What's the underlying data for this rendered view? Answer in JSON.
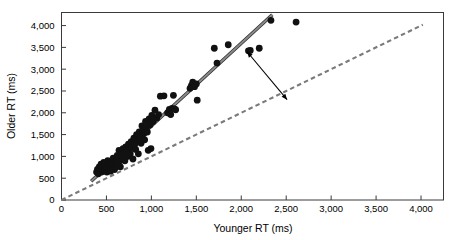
{
  "chart_data": {
    "type": "scatter",
    "title": "",
    "xlabel": "Younger RT (ms)",
    "ylabel": "Older RT (ms)",
    "xlim": [
      0,
      4250
    ],
    "ylim": [
      0,
      4300
    ],
    "xticks": [
      0,
      500,
      1000,
      1500,
      2000,
      2500,
      3000,
      3500,
      4000
    ],
    "xtick_labels": [
      "0",
      "500",
      "1,000",
      "1,500",
      "2,000",
      "2,500",
      "3,000",
      "3,500",
      "4,000"
    ],
    "yticks": [
      0,
      500,
      1000,
      1500,
      2000,
      2500,
      3000,
      3500,
      4000
    ],
    "ytick_labels": [
      "0",
      "500",
      "1,000",
      "1,500",
      "2,000",
      "2,500",
      "3,000",
      "3,500",
      "4,000"
    ],
    "grid": false,
    "legend": "none",
    "marker": "filled-circle",
    "marker_color": "#111111",
    "marker_size": 4.6,
    "points": [
      [
        390,
        640
      ],
      [
        400,
        700
      ],
      [
        410,
        600
      ],
      [
        420,
        760
      ],
      [
        430,
        690
      ],
      [
        440,
        820
      ],
      [
        445,
        640
      ],
      [
        455,
        740
      ],
      [
        460,
        700
      ],
      [
        470,
        860
      ],
      [
        480,
        660
      ],
      [
        490,
        780
      ],
      [
        500,
        720
      ],
      [
        505,
        640
      ],
      [
        515,
        900
      ],
      [
        520,
        760
      ],
      [
        530,
        700
      ],
      [
        540,
        840
      ],
      [
        545,
        660
      ],
      [
        555,
        780
      ],
      [
        565,
        720
      ],
      [
        575,
        960
      ],
      [
        585,
        800
      ],
      [
        590,
        700
      ],
      [
        600,
        880
      ],
      [
        610,
        760
      ],
      [
        620,
        1020
      ],
      [
        630,
        840
      ],
      [
        640,
        1140
      ],
      [
        650,
        900
      ],
      [
        655,
        760
      ],
      [
        665,
        1080
      ],
      [
        675,
        980
      ],
      [
        685,
        1180
      ],
      [
        695,
        1060
      ],
      [
        705,
        900
      ],
      [
        715,
        1220
      ],
      [
        725,
        1120
      ],
      [
        735,
        1000
      ],
      [
        745,
        1280
      ],
      [
        755,
        1160
      ],
      [
        765,
        1060
      ],
      [
        775,
        1340
      ],
      [
        785,
        1200
      ],
      [
        795,
        940
      ],
      [
        805,
        1420
      ],
      [
        815,
        1280
      ],
      [
        825,
        1160
      ],
      [
        835,
        1500
      ],
      [
        845,
        1380
      ],
      [
        855,
        1060
      ],
      [
        865,
        1560
      ],
      [
        875,
        1440
      ],
      [
        885,
        1300
      ],
      [
        895,
        1700
      ],
      [
        905,
        1620
      ],
      [
        915,
        1520
      ],
      [
        925,
        1380
      ],
      [
        935,
        1800
      ],
      [
        945,
        1660
      ],
      [
        955,
        1560
      ],
      [
        965,
        1140
      ],
      [
        975,
        1860
      ],
      [
        985,
        1720
      ],
      [
        995,
        1180
      ],
      [
        1005,
        1940
      ],
      [
        1020,
        1800
      ],
      [
        1040,
        2060
      ],
      [
        1060,
        1880
      ],
      [
        1080,
        1960
      ],
      [
        1100,
        2380
      ],
      [
        1140,
        2390
      ],
      [
        1180,
        2000
      ],
      [
        1200,
        2080
      ],
      [
        1215,
        1960
      ],
      [
        1230,
        2100
      ],
      [
        1245,
        2400
      ],
      [
        1255,
        2090
      ],
      [
        1270,
        2070
      ],
      [
        1430,
        2560
      ],
      [
        1445,
        2620
      ],
      [
        1460,
        2700
      ],
      [
        1480,
        2600
      ],
      [
        1500,
        2660
      ],
      [
        1510,
        2290
      ],
      [
        1700,
        3480
      ],
      [
        1730,
        3140
      ],
      [
        1855,
        3560
      ],
      [
        2080,
        3420
      ],
      [
        2100,
        3430
      ],
      [
        2200,
        3480
      ],
      [
        2330,
        4120
      ],
      [
        2610,
        4080
      ]
    ],
    "lines": [
      {
        "name": "regression-line",
        "style": "solid",
        "color": "#8a8a8a",
        "edge_color": "#2b2b2b",
        "x": [
          330,
          2345
        ],
        "y": [
          430,
          4250
        ]
      },
      {
        "name": "identity-line",
        "style": "dashed",
        "color": "#7a7a7a",
        "x": [
          0,
          4020
        ],
        "y": [
          0,
          4020
        ]
      }
    ],
    "annotations": [
      {
        "name": "gap-arrow",
        "type": "double-headed-arrow",
        "color": "#000000",
        "from": [
          2065,
          3400
        ],
        "to": [
          2510,
          2300
        ]
      }
    ]
  }
}
